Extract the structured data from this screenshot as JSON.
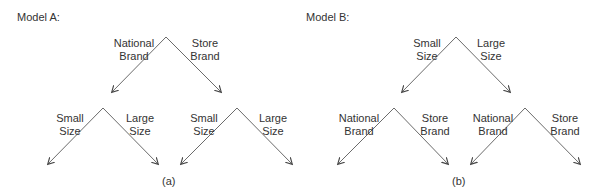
{
  "models": [
    {
      "title": "Model A:",
      "caption": "(a)",
      "top": {
        "left_label": "National\nBrand",
        "right_label": "Store\nBrand"
      },
      "sub_left": {
        "left_label": "Small\nSize",
        "right_label": "Large\nSize"
      },
      "sub_right": {
        "left_label": "Small\nSize",
        "right_label": "Large\nSize"
      }
    },
    {
      "title": "Model B:",
      "caption": "(b)",
      "top": {
        "left_label": "Small\nSize",
        "right_label": "Large\nSize"
      },
      "sub_left": {
        "left_label": "National\nBrand",
        "right_label": "Store\nBrand"
      },
      "sub_right": {
        "left_label": "National\nBrand",
        "right_label": "Store\nBrand"
      }
    }
  ],
  "colors": {
    "line": "#6b6b6b",
    "text": "#333333"
  }
}
